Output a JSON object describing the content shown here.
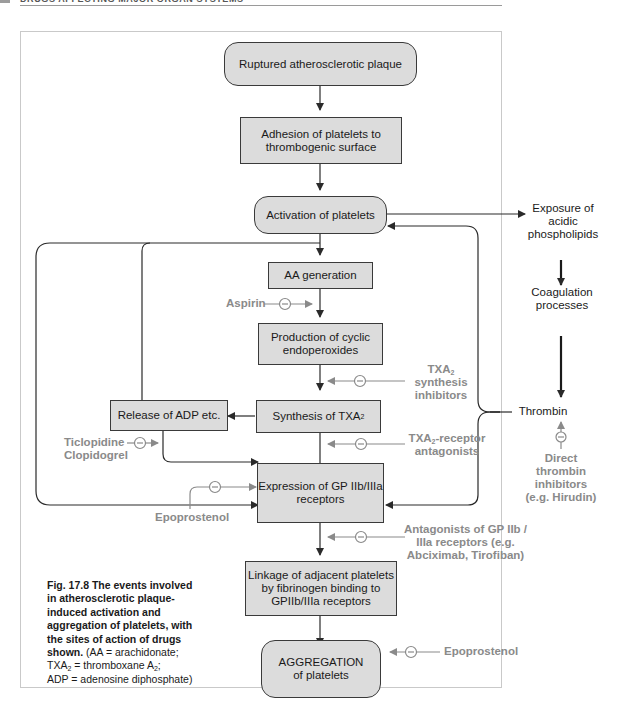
{
  "running_head": "DRUGS AFFECTING MAJOR ORGAN SYSTEMS",
  "nodes": {
    "plaque": "Ruptured atherosclerotic plaque",
    "adhesion": "Adhesion of platelets to thrombogenic surface",
    "activation": "Activation of platelets",
    "aa_generation": "AA generation",
    "endoperoxides": "Production of cyclic endoperoxides",
    "synthesis_txa2": "Synthesis of TXA",
    "synthesis_txa2_sub": "2",
    "release_adp": "Release of ADP etc.",
    "expression_gp": "Expression of GP IIb/IIIa receptors",
    "linkage": "Linkage of adjacent platelets by fibrinogen binding to GPIIb/IIIa receptors",
    "aggregation_line1": "AGGREGATION",
    "aggregation_line2": "of platelets",
    "exposure": "Exposure of acidic phospholipids",
    "coagulation": "Coagulation processes",
    "thrombin": "Thrombin"
  },
  "drugs": {
    "aspirin": "Aspirin",
    "txa2_synthesis_inhibitors_pre": "TXA",
    "txa2_synthesis_inhibitors_sub": "2",
    "txa2_synthesis_inhibitors_rest": "synthesis inhibitors",
    "txa2_receptor_pre": "TXA",
    "txa2_receptor_sub": "2",
    "txa2_receptor_rest": "-receptor antagonists",
    "ticlopidine": "Ticlopidine",
    "clopidogrel": "Clopidogrel",
    "epoprostenol_1": "Epoprostenol",
    "gp_antagonists": "Antagonists of GP IIb / IIIa receptors (e.g. Abciximab, Tirofiban)",
    "direct_thrombin": "Direct thrombin inhibitors (e.g. Hirudin)",
    "epoprostenol_2": "Epoprostenol"
  },
  "caption": {
    "bold": "Fig. 17.8   The events involved in atherosclerotic plaque-induced activation and aggregation of platelets, with the sites of action of drugs shown.",
    "normal_1": " (AA = arachidonate;",
    "normal_2": "TXA",
    "normal_2_sub": "2",
    "normal_3": " = thromboxane A",
    "normal_3_sub": "2",
    "normal_4": ";",
    "normal_5": "ADP = adenosine diphosphate)"
  },
  "colors": {
    "box_fill": "#dcdcdc",
    "box_border": "#3a3a3a",
    "drug_text": "#8a8a8a",
    "arrow": "#2a2a2a",
    "inhibitor_line": "#8a8a8a"
  }
}
